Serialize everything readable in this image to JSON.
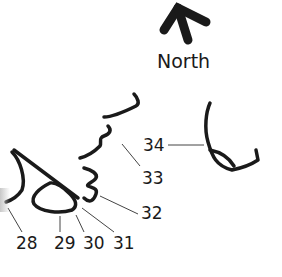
{
  "compass": {
    "icon": "north-arrow-icon",
    "label": "North"
  },
  "callouts": [
    {
      "id": "28",
      "label": "28"
    },
    {
      "id": "29",
      "label": "29"
    },
    {
      "id": "30",
      "label": "30"
    },
    {
      "id": "31",
      "label": "31"
    },
    {
      "id": "32",
      "label": "32"
    },
    {
      "id": "33",
      "label": "33"
    },
    {
      "id": "34",
      "label": "34"
    }
  ],
  "colors": {
    "ink": "#1a1a1a",
    "leader": "#444444",
    "background": "#ffffff"
  }
}
